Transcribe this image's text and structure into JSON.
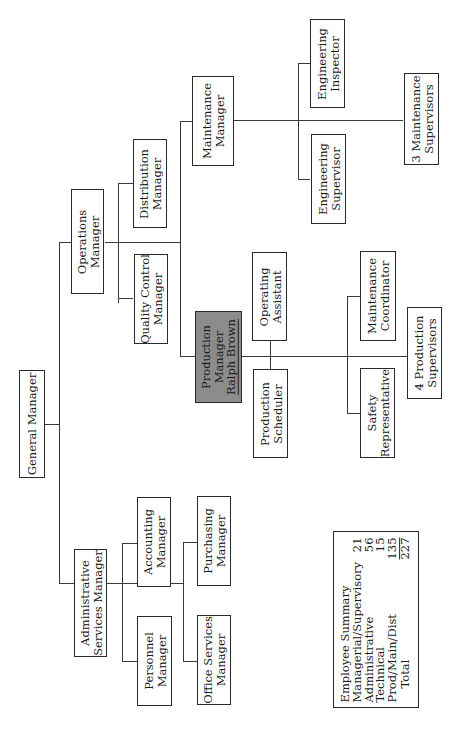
{
  "chart": {
    "orientation": "rotated-90-ccw",
    "nodes": {
      "general_manager": {
        "line1": "General Manager"
      },
      "admin_services_manager": {
        "line1": "Administrative",
        "line2": "Services Manager"
      },
      "personnel_manager": {
        "line1": "Personnel",
        "line2": "Manager"
      },
      "accounting_manager": {
        "line1": "Accounting",
        "line2": "Manager"
      },
      "office_services_manager": {
        "line1": "Office Services",
        "line2": "Manager"
      },
      "purchasing_manager": {
        "line1": "Purchasing",
        "line2": "Manager"
      },
      "operations_manager": {
        "line1": "Operations",
        "line2": "Manager"
      },
      "quality_control_manager": {
        "line1": "Quality Control",
        "line2": "Manager"
      },
      "distribution_manager": {
        "line1": "Distribution",
        "line2": "Manager"
      },
      "maintenance_manager": {
        "line1": "Maintenance",
        "line2": "Manager"
      },
      "engineering_supervisor": {
        "line1": "Engineering",
        "line2": "Supervisor"
      },
      "engineering_inspector": {
        "line1": "Engineering",
        "line2": "Inspector"
      },
      "maintenance_supervisors": {
        "line1": "3 Maintenance",
        "line2": "Supervisors"
      },
      "production_manager": {
        "line1": "Production",
        "line2": "Manager",
        "line3": "Ralph Brown",
        "highlight": "#8c8c8c"
      },
      "production_scheduler": {
        "line1": "Production",
        "line2": "Scheduler"
      },
      "operating_assistant": {
        "line1": "Operating",
        "line2": "Assistant"
      },
      "safety_representative": {
        "line1": "Safety",
        "line2": "Representative"
      },
      "maintenance_coordinator": {
        "line1": "Maintenance",
        "line2": "Coordinator"
      },
      "production_supervisors": {
        "line1": "4 Production",
        "line2": "Supervisors"
      }
    },
    "employee_summary": {
      "title": "Employee Summary",
      "rows": [
        {
          "label": "Managerial/Supervisory",
          "value": "21"
        },
        {
          "label": "Administrative",
          "value": "56"
        },
        {
          "label": "Technical",
          "value": "15"
        },
        {
          "label": "Prod/Main/Dist",
          "value": "135"
        },
        {
          "label": "Total",
          "value": "227"
        }
      ]
    }
  }
}
